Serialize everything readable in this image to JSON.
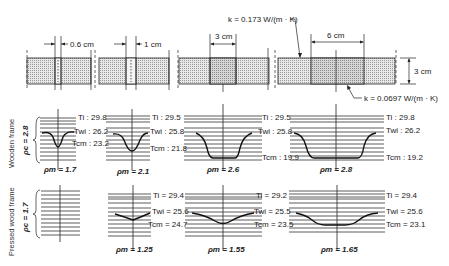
{
  "colors": {
    "ink": "#222222",
    "wood_fill": "#d0d0d0",
    "insulation_fill": "#e4e4e4",
    "background": "#ffffff"
  },
  "top_row": {
    "thickness_label": "3 cm",
    "k_frame_label": "k = 0.173 W/(m · K)",
    "k_insulation_label": "k = 0.0697 W/(m · K)",
    "specimens": [
      {
        "gap_label": "0.6 cm"
      },
      {
        "gap_label": "1 cm"
      },
      {
        "gap_label": "3 cm"
      },
      {
        "gap_label": "6 cm"
      }
    ]
  },
  "rows": [
    {
      "group_label": "Wooden frame",
      "rho_c_label": "ρc = 2.8",
      "panels": [
        {
          "ti": "Ti : 29.8",
          "twi": "Twi : 26.2",
          "tcm": "Tcm : 23.2",
          "rho_m": "ρm = 1.7"
        },
        {
          "ti": "Ti : 29.5",
          "twi": "Twi : 25.8",
          "tcm": "Tcm : 21.8",
          "rho_m": "ρm = 2.1"
        },
        {
          "ti": "Ti : 29.5",
          "twi": "Twi : 25.8",
          "tcm": "Tcm : 19.9",
          "rho_m": "ρm = 2.6"
        },
        {
          "ti": "Ti : 29.8",
          "twi": "Twi : 26.2",
          "tcm": "Tcm : 19.2",
          "rho_m": "ρm = 2.8"
        }
      ]
    },
    {
      "group_label": "Pressed wood frame",
      "rho_c_label": "ρc = 1.7",
      "panels": [
        {
          "ti": "",
          "twi": "",
          "tcm": "",
          "rho_m": ""
        },
        {
          "ti": "Ti = 29.4",
          "twi": "Twi = 25.6",
          "tcm": "Tcm = 24.7",
          "rho_m": "ρm = 1.25"
        },
        {
          "ti": "Ti = 29.2",
          "twi": "Twi = 25.5",
          "tcm": "Tcm = 23.5",
          "rho_m": "ρm = 1.55"
        },
        {
          "ti": "Ti = 29.4",
          "twi": "Twi = 25.6",
          "tcm": "Tcm = 23.1",
          "rho_m": "ρm = 1.65"
        }
      ]
    }
  ]
}
